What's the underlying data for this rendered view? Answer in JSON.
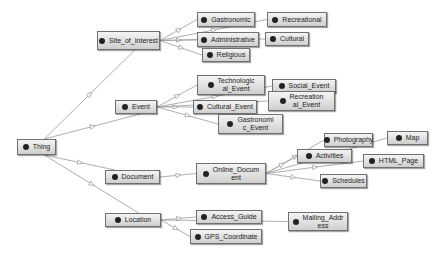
{
  "diagram": {
    "type": "ontology-class-hierarchy",
    "nodes": [
      {
        "id": "thing",
        "label": "Thing",
        "x": 17,
        "y": 139,
        "w": 39,
        "h": 16
      },
      {
        "id": "site_of_interest",
        "label": "Site_of_Interest",
        "x": 97,
        "y": 31,
        "w": 63,
        "h": 19
      },
      {
        "id": "event",
        "label": "Event",
        "x": 115,
        "y": 100,
        "w": 42,
        "h": 14
      },
      {
        "id": "document",
        "label": "Document",
        "x": 105,
        "y": 170,
        "w": 55,
        "h": 14
      },
      {
        "id": "location",
        "label": "Location",
        "x": 105,
        "y": 213,
        "w": 56,
        "h": 14
      },
      {
        "id": "gastronomic",
        "label": "Gastronomic",
        "x": 197,
        "y": 12,
        "w": 58,
        "h": 15
      },
      {
        "id": "administrative",
        "label": "Administrative",
        "x": 197,
        "y": 32,
        "w": 62,
        "h": 15
      },
      {
        "id": "religious",
        "label": "Religious",
        "x": 202,
        "y": 48,
        "w": 48,
        "h": 14
      },
      {
        "id": "recreational",
        "label": "Recreational",
        "x": 267,
        "y": 12,
        "w": 60,
        "h": 15
      },
      {
        "id": "cultural",
        "label": "Cultural",
        "x": 265,
        "y": 32,
        "w": 44,
        "h": 14
      },
      {
        "id": "technological_event",
        "label": "Technologic\nal_Event",
        "x": 197,
        "y": 75,
        "w": 68,
        "h": 20
      },
      {
        "id": "social_event",
        "label": "Social_Event",
        "x": 272,
        "y": 79,
        "w": 64,
        "h": 14
      },
      {
        "id": "cultural_event",
        "label": "Cultural_Event",
        "x": 193,
        "y": 100,
        "w": 64,
        "h": 14
      },
      {
        "id": "recreational_event",
        "label": "Recreation\nal_Event",
        "x": 268,
        "y": 91,
        "w": 67,
        "h": 20
      },
      {
        "id": "gastronomic_event",
        "label": "Gastronomi\nc_Event",
        "x": 218,
        "y": 114,
        "w": 65,
        "h": 20
      },
      {
        "id": "online_document",
        "label": "Online_Docum\nent",
        "x": 196,
        "y": 163,
        "w": 70,
        "h": 21
      },
      {
        "id": "photography",
        "label": "Photography",
        "x": 324,
        "y": 133,
        "w": 49,
        "h": 14
      },
      {
        "id": "map",
        "label": "Map",
        "x": 387,
        "y": 131,
        "w": 41,
        "h": 14
      },
      {
        "id": "activities",
        "label": "Activities",
        "x": 297,
        "y": 149,
        "w": 55,
        "h": 14
      },
      {
        "id": "html_page",
        "label": "HTML_Page",
        "x": 363,
        "y": 154,
        "w": 61,
        "h": 14
      },
      {
        "id": "schedules",
        "label": "Schedules",
        "x": 320,
        "y": 174,
        "w": 47,
        "h": 14
      },
      {
        "id": "access_guide",
        "label": "Access_Guide",
        "x": 196,
        "y": 210,
        "w": 66,
        "h": 14
      },
      {
        "id": "gps_coordinate",
        "label": "GPS_Coordinate",
        "x": 190,
        "y": 229,
        "w": 72,
        "h": 15
      },
      {
        "id": "mailing_address",
        "label": "Mailing_Addr\ness",
        "x": 288,
        "y": 212,
        "w": 60,
        "h": 19
      }
    ],
    "edges": [
      {
        "from": "thing",
        "to": "site_of_interest"
      },
      {
        "from": "thing",
        "to": "event"
      },
      {
        "from": "thing",
        "to": "document"
      },
      {
        "from": "thing",
        "to": "location"
      },
      {
        "from": "site_of_interest",
        "to": "gastronomic"
      },
      {
        "from": "site_of_interest",
        "to": "administrative"
      },
      {
        "from": "site_of_interest",
        "to": "religious"
      },
      {
        "from": "site_of_interest",
        "to": "recreational"
      },
      {
        "from": "site_of_interest",
        "to": "cultural"
      },
      {
        "from": "event",
        "to": "technological_event"
      },
      {
        "from": "event",
        "to": "social_event"
      },
      {
        "from": "event",
        "to": "cultural_event"
      },
      {
        "from": "event",
        "to": "recreational_event"
      },
      {
        "from": "event",
        "to": "gastronomic_event"
      },
      {
        "from": "document",
        "to": "online_document"
      },
      {
        "from": "online_document",
        "to": "photography"
      },
      {
        "from": "online_document",
        "to": "map"
      },
      {
        "from": "online_document",
        "to": "activities"
      },
      {
        "from": "online_document",
        "to": "html_page"
      },
      {
        "from": "online_document",
        "to": "schedules"
      },
      {
        "from": "location",
        "to": "access_guide"
      },
      {
        "from": "location",
        "to": "gps_coordinate"
      },
      {
        "from": "location",
        "to": "mailing_address"
      }
    ],
    "colors": {
      "edge": "#9a9a9a",
      "node_border": "#707070",
      "dot": "#222222",
      "background": "#ffffff"
    }
  }
}
